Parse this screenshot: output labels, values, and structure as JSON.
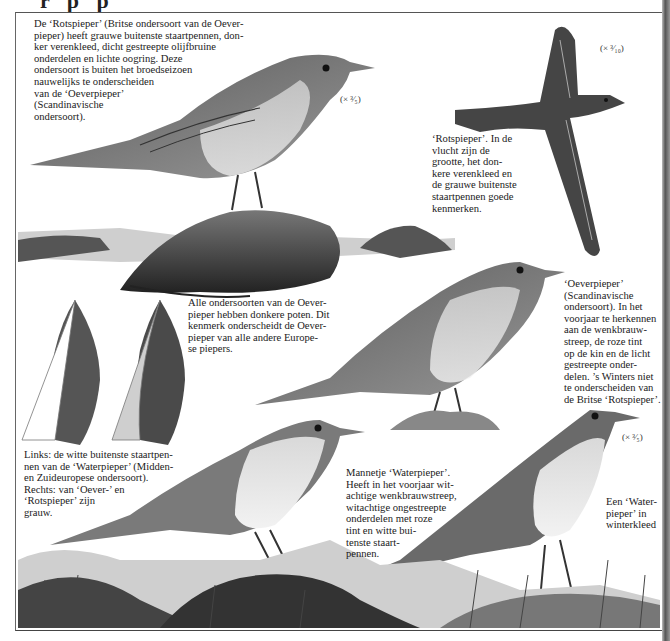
{
  "page": {
    "header_fragment": "r  p  p"
  },
  "captions": {
    "rotspieper_intro": "De ‘Rotspieper’ (Britse ondersoort van de Oever-\npieper) heeft grauwe buitenste staartpennen, don-\nker verenkleed, dicht gestreepte olijfbruine\nonderdelen en lichte oogring. Deze\nondersoort is buiten het broedseizoen\nnauwelijks te onderscheiden\nvan de ‘Oeverpieper’\n(Scandinavische\nondersoort).",
    "rotspieper_flight": "‘Rotspieper’. In de\nvlucht zijn de\ngrootte, het don-\nkere verenkleed en\nde grauwe buitenste\nstaartpennen goede\nkenmerken.",
    "legs_note": "Alle ondersoorten van de Oever-\npieper hebben donkere poten. Dit\nkenmerk onderscheidt de Oever-\npieper van alle andere Europe-\nse piepers.",
    "oeverpieper": "‘Oeverpieper’\n(Scandinavische\nondersoort). In het\nvoorjaar te herkennen\naan de wenkbrauw-\nstreep, de roze tint\nop de kin en de licht\ngestreepte onder-\ndelen. ’s Winters niet\nte onderscheiden van\nde Britse ‘Rotspieper’.",
    "tail_feathers": "Links: de witte buitenste staartpen-\nnen van de ‘Waterpieper’ (Midden-\nen Zuideuropese ondersoort).\nRechts: van ‘Oever-’ en\n‘Rotspieper’ zijn\n   grauw.",
    "waterpieper_male": "Mannetje ‘Waterpieper’.\nHeeft in het voorjaar wit-\nachtige wenkbrauwstreep,\nwitachtige ongestreepte\nonderdelen met roze\ntint en witte bui-\ntenste staart-\npennen.",
    "waterpieper_winter": "Een ‘Water-\npieper’ in\nwinterkleed"
  },
  "scales": {
    "perched_rotspieper": "(× ³⁄₅)",
    "flying_rotspieper": "(× ³⁄₁₀)",
    "winter_waterpieper": "(× ³⁄₅)"
  },
  "colors": {
    "ink": "#1b1b1b",
    "plumage_dark": "#3a3a3a",
    "plumage_mid": "#6e6e6e",
    "rock": "#4a4a4a",
    "sky_wash": "#d8d8d8"
  }
}
